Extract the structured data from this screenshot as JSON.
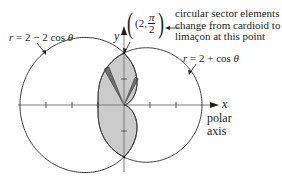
{
  "figure": {
    "curves": [
      {
        "id": "cardioid",
        "equation_label": "r = 2 − 2 cos θ",
        "lhs": "r",
        "rhs": "= 2 − 2 cos",
        "var": "θ"
      },
      {
        "id": "limacon",
        "equation_label": "r = 2 + cos θ",
        "lhs": "r",
        "rhs": "= 2 + cos",
        "var": "θ"
      }
    ],
    "point": {
      "open": "(2,",
      "numerator": "π",
      "denominator": "2",
      "close": ")"
    },
    "annotation": {
      "line1": "circular sector elements",
      "line2": "change from cardioid to",
      "line3": "limaçon at this point"
    },
    "axes": {
      "x_label": "x",
      "y_label": "y",
      "polar_axis_line1": "polar",
      "polar_axis_line2": "axis"
    },
    "colors": {
      "curve": "#3a3a3a",
      "shaded_region": "#c9c9c9",
      "sector": "#6e6e6e",
      "axis": "#7a7a7a"
    },
    "geometry": {
      "origin_px": [
        124,
        105
      ],
      "scale_px_per_unit": 26
    }
  }
}
